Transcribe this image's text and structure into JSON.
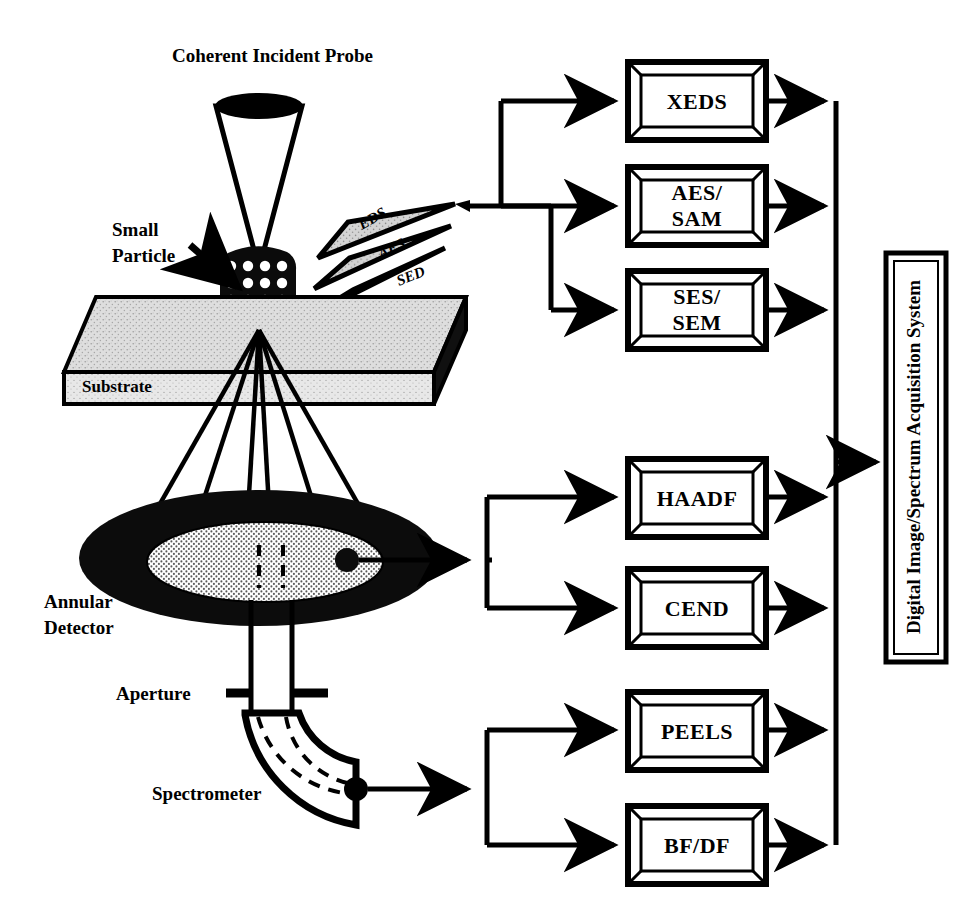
{
  "figure": {
    "title": "Coherent Incident Probe",
    "type": "schematic-diagram"
  },
  "annotations": {
    "probe_label": "Coherent Incident Probe",
    "particle_label_line1": "Small",
    "particle_label_line2": "Particle",
    "substrate_label": "Substrate",
    "detector_label_line1": "Annular",
    "detector_label_line2": "Detector",
    "aperture_label": "Aperture",
    "spectrometer_label": "Spectrometer"
  },
  "emitted_signals": [
    {
      "id": "eds",
      "label": "EDS"
    },
    {
      "id": "aes",
      "label": "AES"
    },
    {
      "id": "sed",
      "label": "SED"
    }
  ],
  "detector_boxes": {
    "upper_group": [
      {
        "id": "xeds",
        "label": "XEDS",
        "lines": [
          "XEDS"
        ]
      },
      {
        "id": "aes-sam",
        "label": "AES/SAM",
        "lines": [
          "AES/",
          "SAM"
        ]
      },
      {
        "id": "ses-sem",
        "label": "SES/SEM",
        "lines": [
          "SES/",
          "SEM"
        ]
      }
    ],
    "middle_group": [
      {
        "id": "haadf",
        "label": "HAADF",
        "lines": [
          "HAADF"
        ]
      },
      {
        "id": "cend",
        "label": "CEND",
        "lines": [
          "CEND"
        ]
      }
    ],
    "lower_group": [
      {
        "id": "peels",
        "label": "PEELS",
        "lines": [
          "PEELS"
        ]
      },
      {
        "id": "bf-df",
        "label": "BF/DF",
        "lines": [
          "BF/DF"
        ]
      }
    ]
  },
  "acquisition_system": {
    "label": "Digital Image/Spectrum Acquisition System",
    "orientation": "vertical-bottom-to-top"
  },
  "colors": {
    "ink": "#000000",
    "paper": "#ffffff",
    "substrate_top": "#d8d8d8",
    "substrate_front": "#e2e2e2",
    "substrate_side": "#111111",
    "detector_ring": "#111111",
    "detector_inner": "#e6e6e6",
    "fan_fill": "#d0d0d0"
  }
}
